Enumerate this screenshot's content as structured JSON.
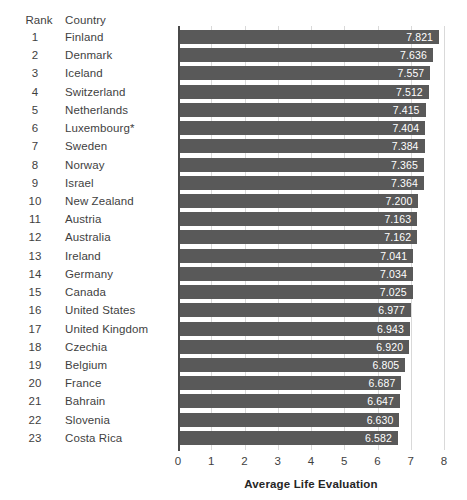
{
  "table": {
    "headers": {
      "rank": "Rank",
      "country": "Country"
    }
  },
  "axis": {
    "title": "Average Life Evaluation",
    "ticks": [
      "0",
      "1",
      "2",
      "3",
      "4",
      "5",
      "6",
      "7",
      "8"
    ],
    "xmin": 0,
    "xmax": 8
  },
  "colors": {
    "bar": "#595959",
    "gridline": "#d9d9d9",
    "axis": "#4a4a4a",
    "label_text": "#ffffff",
    "body_text": "#3f3f3f",
    "background": "#ffffff"
  },
  "chart_data": {
    "type": "bar",
    "orientation": "horizontal",
    "title": "",
    "subtitle": "",
    "xlabel": "Average Life Evaluation",
    "ylabel": "",
    "xlim": [
      0,
      8
    ],
    "xticks": [
      0,
      1,
      2,
      3,
      4,
      5,
      6,
      7,
      8
    ],
    "grid": true,
    "legend": false,
    "value_labels": true,
    "value_label_format": "0.000",
    "categories": [
      "Finland",
      "Denmark",
      "Iceland",
      "Switzerland",
      "Netherlands",
      "Luxembourg*",
      "Sweden",
      "Norway",
      "Israel",
      "New Zealand",
      "Austria",
      "Australia",
      "Ireland",
      "Germany",
      "Canada",
      "United States",
      "United Kingdom",
      "Czechia",
      "Belgium",
      "France",
      "Bahrain",
      "Slovenia",
      "Costa Rica"
    ],
    "ranks": [
      1,
      2,
      3,
      4,
      5,
      6,
      7,
      8,
      9,
      10,
      11,
      12,
      13,
      14,
      15,
      16,
      17,
      18,
      19,
      20,
      21,
      22,
      23
    ],
    "values": [
      7.821,
      7.636,
      7.557,
      7.512,
      7.415,
      7.404,
      7.384,
      7.365,
      7.364,
      7.2,
      7.163,
      7.162,
      7.041,
      7.034,
      7.025,
      6.977,
      6.943,
      6.92,
      6.805,
      6.687,
      6.647,
      6.63,
      6.582
    ],
    "value_labels_text": [
      "7.821",
      "7.636",
      "7.557",
      "7.512",
      "7.415",
      "7.404",
      "7.384",
      "7.365",
      "7.364",
      "7.200",
      "7.163",
      "7.162",
      "7.041",
      "7.034",
      "7.025",
      "6.977",
      "6.943",
      "6.920",
      "6.805",
      "6.687",
      "6.647",
      "6.630",
      "6.582"
    ],
    "rank_labels": [
      "1",
      "2",
      "3",
      "4",
      "5",
      "6",
      "7",
      "8",
      "9",
      "10",
      "11",
      "12",
      "13",
      "14",
      "15",
      "16",
      "17",
      "18",
      "19",
      "20",
      "21",
      "22",
      "23"
    ],
    "annotations": [
      "* Luxembourg marked with asterisk"
    ]
  }
}
